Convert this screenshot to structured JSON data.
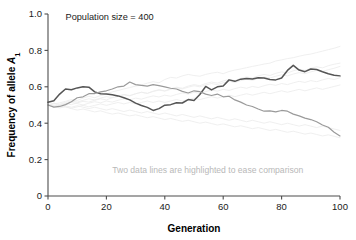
{
  "figure": {
    "note": "Population size = 400",
    "annotation": "Two data lines are highlighted to ease comparison",
    "background_color": "#ffffff"
  },
  "chart_data": {
    "type": "line",
    "title": "Population size = 400",
    "xlabel": "Generation",
    "ylabel": "Frequency of allele A1",
    "ylabel_parts": {
      "main": "Frequency of allele ",
      "italic": "A",
      "subscript": "1"
    },
    "xlim": [
      0,
      100
    ],
    "ylim": [
      0,
      1.0
    ],
    "xticks": [
      0,
      20,
      40,
      60,
      80,
      100
    ],
    "xtick_labels": [
      "0",
      "20",
      "40",
      "60",
      "80",
      "100"
    ],
    "yticks": [
      0,
      0.2,
      0.4,
      0.6,
      0.8,
      1.0
    ],
    "ytick_labels": [
      "0",
      "0.2",
      "0.4",
      "0.6",
      "0.8",
      "1.0"
    ],
    "grid": false,
    "legend": "none",
    "annotations": [
      {
        "text": "Population size = 400",
        "x": 6,
        "y": 0.965,
        "color": "#1a1a1a"
      },
      {
        "text": "Two data lines are highlighted to ease comparison",
        "x": 22,
        "y": 0.125,
        "color": "#b8b8b8"
      }
    ],
    "colors": {
      "highlight_dark": "#555555",
      "highlight_mid": "#9a9a9a",
      "background_lines": "#ececec",
      "axis": "#4d4d4d"
    },
    "x": [
      0,
      2,
      4,
      6,
      8,
      10,
      12,
      14,
      16,
      18,
      20,
      22,
      24,
      26,
      28,
      30,
      32,
      34,
      36,
      38,
      40,
      42,
      44,
      46,
      48,
      50,
      52,
      54,
      56,
      58,
      60,
      62,
      64,
      66,
      68,
      70,
      72,
      74,
      76,
      78,
      80,
      82,
      84,
      86,
      88,
      90,
      92,
      94,
      96,
      98,
      100
    ],
    "series": [
      {
        "name": "highlighted-dark",
        "highlighted": true,
        "color": "#555555",
        "values": [
          0.515,
          0.523,
          0.56,
          0.588,
          0.584,
          0.594,
          0.6,
          0.598,
          0.572,
          0.562,
          0.56,
          0.556,
          0.55,
          0.54,
          0.528,
          0.51,
          0.497,
          0.487,
          0.47,
          0.48,
          0.499,
          0.502,
          0.512,
          0.511,
          0.53,
          0.525,
          0.558,
          0.602,
          0.583,
          0.6,
          0.604,
          0.638,
          0.63,
          0.642,
          0.645,
          0.643,
          0.65,
          0.648,
          0.64,
          0.638,
          0.648,
          0.69,
          0.718,
          0.692,
          0.683,
          0.698,
          0.695,
          0.683,
          0.672,
          0.664,
          0.66
        ]
      },
      {
        "name": "highlighted-mid",
        "highlighted": true,
        "color": "#9a9a9a",
        "values": [
          0.5,
          0.488,
          0.492,
          0.502,
          0.518,
          0.54,
          0.545,
          0.562,
          0.563,
          0.572,
          0.578,
          0.588,
          0.6,
          0.604,
          0.626,
          0.612,
          0.608,
          0.604,
          0.612,
          0.606,
          0.6,
          0.592,
          0.588,
          0.575,
          0.566,
          0.578,
          0.573,
          0.56,
          0.552,
          0.56,
          0.545,
          0.548,
          0.528,
          0.516,
          0.5,
          0.492,
          0.478,
          0.466,
          0.468,
          0.462,
          0.47,
          0.466,
          0.45,
          0.44,
          0.428,
          0.42,
          0.408,
          0.39,
          0.378,
          0.35,
          0.33
        ]
      },
      {
        "name": "background-1",
        "highlighted": false,
        "color": "#ececec",
        "values": [
          0.5,
          0.506,
          0.512,
          0.52,
          0.53,
          0.525,
          0.538,
          0.548,
          0.54,
          0.552,
          0.56,
          0.572,
          0.58,
          0.588,
          0.596,
          0.604,
          0.61,
          0.62,
          0.628,
          0.622,
          0.64,
          0.652,
          0.648,
          0.66,
          0.668,
          0.662,
          0.658,
          0.668,
          0.675,
          0.68,
          0.672,
          0.684,
          0.692,
          0.698,
          0.705,
          0.712,
          0.718,
          0.725,
          0.73,
          0.742,
          0.748,
          0.755,
          0.76,
          0.768,
          0.775,
          0.78,
          0.788,
          0.796,
          0.804,
          0.812,
          0.822
        ]
      },
      {
        "name": "background-2",
        "highlighted": false,
        "color": "#ececec",
        "values": [
          0.5,
          0.494,
          0.5,
          0.508,
          0.502,
          0.512,
          0.52,
          0.516,
          0.526,
          0.534,
          0.528,
          0.54,
          0.548,
          0.556,
          0.55,
          0.562,
          0.57,
          0.564,
          0.576,
          0.584,
          0.578,
          0.59,
          0.598,
          0.592,
          0.604,
          0.612,
          0.606,
          0.618,
          0.626,
          0.62,
          0.632,
          0.64,
          0.634,
          0.646,
          0.654,
          0.648,
          0.66,
          0.668,
          0.662,
          0.674,
          0.682,
          0.676,
          0.688,
          0.696,
          0.69,
          0.702,
          0.71,
          0.704,
          0.716,
          0.724,
          0.73
        ]
      },
      {
        "name": "background-3",
        "highlighted": false,
        "color": "#ececec",
        "values": [
          0.5,
          0.508,
          0.498,
          0.506,
          0.514,
          0.508,
          0.5,
          0.51,
          0.518,
          0.512,
          0.522,
          0.516,
          0.526,
          0.534,
          0.528,
          0.538,
          0.532,
          0.542,
          0.55,
          0.544,
          0.554,
          0.548,
          0.558,
          0.566,
          0.56,
          0.57,
          0.564,
          0.574,
          0.582,
          0.576,
          0.586,
          0.58,
          0.59,
          0.598,
          0.592,
          0.602,
          0.596,
          0.606,
          0.614,
          0.608,
          0.618,
          0.612,
          0.622,
          0.63,
          0.624,
          0.634,
          0.628,
          0.638,
          0.646,
          0.64,
          0.65
        ]
      },
      {
        "name": "background-4",
        "highlighted": false,
        "color": "#ececec",
        "values": [
          0.5,
          0.492,
          0.484,
          0.49,
          0.48,
          0.472,
          0.478,
          0.47,
          0.462,
          0.468,
          0.458,
          0.45,
          0.456,
          0.448,
          0.44,
          0.446,
          0.438,
          0.43,
          0.436,
          0.428,
          0.42,
          0.426,
          0.418,
          0.41,
          0.416,
          0.408,
          0.4,
          0.406,
          0.398,
          0.39,
          0.396,
          0.388,
          0.38,
          0.386,
          0.378,
          0.37,
          0.376,
          0.368,
          0.36,
          0.366,
          0.358,
          0.35,
          0.356,
          0.348,
          0.34,
          0.346,
          0.338,
          0.33,
          0.336,
          0.328,
          0.32
        ]
      },
      {
        "name": "background-5",
        "highlighted": false,
        "color": "#ececec",
        "values": [
          0.5,
          0.496,
          0.488,
          0.496,
          0.488,
          0.496,
          0.488,
          0.48,
          0.488,
          0.48,
          0.472,
          0.48,
          0.472,
          0.464,
          0.472,
          0.464,
          0.456,
          0.464,
          0.456,
          0.448,
          0.456,
          0.448,
          0.44,
          0.448,
          0.44,
          0.432,
          0.44,
          0.432,
          0.424,
          0.432,
          0.424,
          0.416,
          0.424,
          0.416,
          0.408,
          0.416,
          0.408,
          0.4,
          0.408,
          0.4,
          0.392,
          0.4,
          0.392,
          0.384,
          0.392,
          0.384,
          0.376,
          0.384,
          0.376,
          0.368,
          0.36
        ]
      },
      {
        "name": "background-6",
        "highlighted": false,
        "color": "#ececec",
        "values": [
          0.5,
          0.51,
          0.504,
          0.514,
          0.522,
          0.516,
          0.526,
          0.534,
          0.528,
          0.538,
          0.546,
          0.54,
          0.55,
          0.558,
          0.552,
          0.562,
          0.57,
          0.564,
          0.574,
          0.582,
          0.576,
          0.586,
          0.594,
          0.588,
          0.598,
          0.606,
          0.6,
          0.61,
          0.618,
          0.612,
          0.622,
          0.63,
          0.624,
          0.634,
          0.642,
          0.636,
          0.646,
          0.654,
          0.648,
          0.658,
          0.666,
          0.66,
          0.67,
          0.678,
          0.672,
          0.682,
          0.69,
          0.684,
          0.694,
          0.702,
          0.712
        ]
      },
      {
        "name": "background-7",
        "highlighted": false,
        "color": "#ececec",
        "values": [
          0.5,
          0.49,
          0.498,
          0.49,
          0.482,
          0.49,
          0.498,
          0.49,
          0.498,
          0.506,
          0.498,
          0.506,
          0.514,
          0.506,
          0.514,
          0.506,
          0.514,
          0.522,
          0.514,
          0.522,
          0.514,
          0.522,
          0.53,
          0.522,
          0.53,
          0.538,
          0.53,
          0.538,
          0.546,
          0.538,
          0.546,
          0.554,
          0.546,
          0.554,
          0.562,
          0.554,
          0.562,
          0.57,
          0.562,
          0.57,
          0.578,
          0.57,
          0.578,
          0.586,
          0.578,
          0.586,
          0.594,
          0.586,
          0.594,
          0.602,
          0.61
        ]
      }
    ]
  }
}
